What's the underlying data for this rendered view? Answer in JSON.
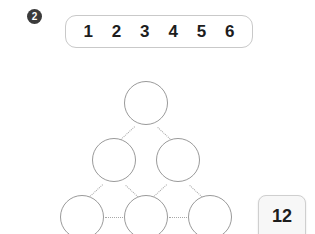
{
  "question": {
    "badge_label": "2",
    "badge_color": "#3b3b3b"
  },
  "number_bar": {
    "numbers": [
      "1",
      "2",
      "3",
      "4",
      "5",
      "6"
    ]
  },
  "pyramid": {
    "stroke_color": "#9a9a9a",
    "connector_color": "#a8a8a8",
    "rows": [
      {
        "cells": [
          {
            "value": ""
          }
        ]
      },
      {
        "cells": [
          {
            "value": ""
          },
          {
            "value": ""
          }
        ]
      },
      {
        "cells": [
          {
            "value": ""
          },
          {
            "value": ""
          },
          {
            "value": ""
          }
        ]
      }
    ]
  },
  "answer_tile": {
    "value": "12"
  }
}
